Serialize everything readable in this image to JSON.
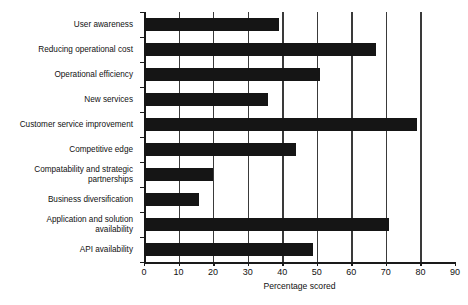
{
  "chart_data": {
    "type": "bar",
    "orientation": "horizontal",
    "title": "",
    "xlabel": "Percentage scored",
    "ylabel": "",
    "xlim": [
      0,
      90
    ],
    "xticks": [
      0,
      10,
      20,
      30,
      40,
      50,
      60,
      70,
      80,
      90
    ],
    "xtick_labels": [
      "0",
      "10",
      "20",
      "30",
      "40",
      "50",
      "60",
      "70",
      "80",
      "90"
    ],
    "grid": "vertical",
    "legend": "none",
    "bar_color": "#151515",
    "categories": [
      "User awareness",
      "Reducing operational cost",
      "Operational efficiency",
      "New services",
      "Customer service improvement",
      "Competitive edge",
      "Compatability and strategic\npartnerships",
      "Business diversification",
      "Application and solution\navailability",
      "API availability"
    ],
    "values": [
      39,
      67,
      51,
      36,
      79,
      44,
      20,
      16,
      71,
      49
    ]
  }
}
